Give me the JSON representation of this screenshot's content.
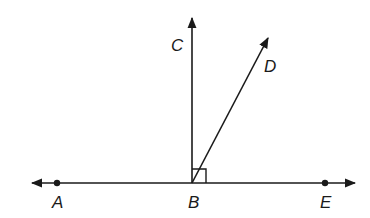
{
  "diagram": {
    "type": "geometry-angles",
    "stroke_color": "#1a1a1a",
    "background": "#ffffff",
    "points": [
      {
        "id": "A",
        "label": "A",
        "x": 57,
        "y": 183,
        "dot": true
      },
      {
        "id": "B",
        "label": "B",
        "x": 192,
        "y": 183,
        "dot": false
      },
      {
        "id": "E",
        "label": "E",
        "x": 325,
        "y": 183,
        "dot": true
      },
      {
        "id": "C",
        "label": "C",
        "x": 192,
        "y": 18,
        "dot": false
      },
      {
        "id": "D",
        "label": "D",
        "x": 268,
        "y": 38,
        "dot": false
      }
    ],
    "labels": {
      "A": "A",
      "B": "B",
      "C": "C",
      "D": "D",
      "E": "E"
    },
    "elements": [
      {
        "type": "line",
        "name": "line-AE",
        "through": [
          "A",
          "B",
          "E"
        ],
        "arrows": "both"
      },
      {
        "type": "ray",
        "name": "ray-BC",
        "from": "B",
        "through": "C"
      },
      {
        "type": "ray",
        "name": "ray-BD",
        "from": "B",
        "through": "D"
      },
      {
        "type": "right-angle-marker",
        "name": "right-angle-CBE",
        "vertex": "B",
        "between": [
          "C",
          "E"
        ]
      }
    ]
  }
}
